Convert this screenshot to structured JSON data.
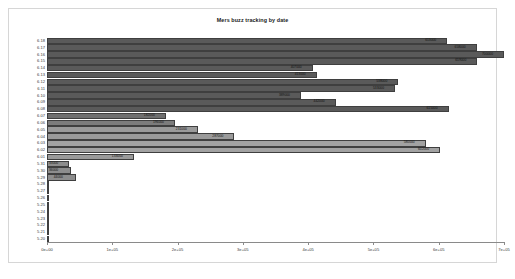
{
  "chart": {
    "title": "Mers buzz tracking by date",
    "xlabel": "",
    "ylabel": ""
  },
  "axis": {
    "ticks": [
      "0e+00",
      "1e+05",
      "2e+05",
      "3e+05",
      "4e+05",
      "5e+05",
      "6e+05",
      "7e+05"
    ]
  },
  "chart_data": {
    "type": "bar",
    "orientation": "horizontal",
    "title": "Mers buzz tracking by date",
    "xlabel": "",
    "ylabel": "",
    "xlim": [
      0,
      700000
    ],
    "ylim": null,
    "grid": false,
    "legend": null,
    "xticks": [
      0,
      100000,
      200000,
      300000,
      400000,
      500000,
      600000,
      700000
    ],
    "xticklabels": [
      "0e+00",
      "1e+05",
      "2e+05",
      "3e+05",
      "4e+05",
      "5e+05",
      "6e+05",
      "7e+05"
    ],
    "categories": [
      "6.18",
      "6.17",
      "6.16",
      "6.15",
      "6.14",
      "6.13",
      "6.12",
      "6.11",
      "6.10",
      "6.09",
      "6.08",
      "6.07",
      "6.06",
      "6.05",
      "6.04",
      "6.03",
      "6.02",
      "6.01",
      "5.31",
      "5.30",
      "5.29",
      "5.28",
      "5.27",
      "5.26",
      "5.25",
      "5.24",
      "5.23",
      "5.22",
      "5.21",
      "5.20"
    ],
    "values": [
      613000,
      658000,
      700000,
      659000,
      407000,
      413000,
      538000,
      533000,
      389000,
      442000,
      615000,
      182000,
      196000,
      231000,
      287000,
      580000,
      602000,
      133000,
      33000,
      36000,
      44000,
      3000,
      2000,
      2000,
      1500,
      1500,
      1500,
      1200,
      1500,
      1500
    ],
    "bar_labels": [
      "613000",
      "658000",
      "700000",
      "659000",
      "407000",
      "413000",
      "538000",
      "533000",
      "389000",
      "442000",
      "615000",
      "182000",
      "196000",
      "231000",
      "287000",
      "580000",
      "602000",
      "133000",
      "33000",
      "36000",
      "44000",
      "",
      "",
      "",
      "",
      "",
      "",
      "",
      "",
      ""
    ],
    "colors": [
      "#5a5a5a",
      "#5a5a5a",
      "#5a5a5a",
      "#5a5a5a",
      "#5a5a5a",
      "#5a5a5a",
      "#5a5a5a",
      "#5a5a5a",
      "#5a5a5a",
      "#5a5a5a",
      "#5a5a5a",
      "#6f6f6f",
      "#7c7c7c",
      "#9a9a9a",
      "#9a9a9a",
      "#a2a2a2",
      "#a2a2a2",
      "#9a9a9a",
      "#8d8d8d",
      "#8d8d8d",
      "#8d8d8d",
      "#8d8d8d",
      "#8d8d8d",
      "#8d8d8d",
      "#8d8d8d",
      "#8d8d8d",
      "#8d8d8d",
      "#8d8d8d",
      "#8d8d8d",
      "#8d8d8d"
    ]
  }
}
